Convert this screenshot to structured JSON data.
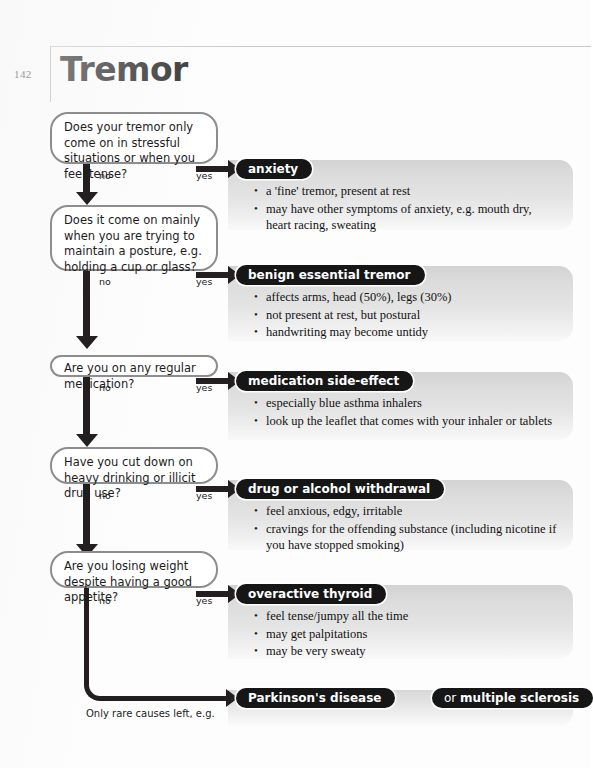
{
  "header": {
    "page_number": "142",
    "title": "Tremor"
  },
  "branch_labels": {
    "no": "no",
    "yes": "yes"
  },
  "footer_note": "Only rare causes left, e.g.",
  "questions": [
    {
      "text": "Does your tremor only come on in stressful situations or when you feel tense?"
    },
    {
      "text": "Does it come on mainly when you are trying to maintain a posture, e.g. holding a cup or glass?"
    },
    {
      "text": "Are you on any regular medication?"
    },
    {
      "text": "Have you cut down on heavy drinking or illicit drug use?"
    },
    {
      "text": "Are you losing weight despite having a good appetite?"
    }
  ],
  "outcomes": [
    {
      "tag": "anxiety",
      "bullets": [
        "a 'fine' tremor, present at rest",
        "may have other symptoms of anxiety, e.g. mouth dry, heart racing, sweating"
      ]
    },
    {
      "tag": "benign essential tremor",
      "bullets": [
        "affects arms, head (50%), legs (30%)",
        "not present at rest, but postural",
        "handwriting may become untidy"
      ]
    },
    {
      "tag": "medication side-effect",
      "bullets": [
        "especially blue asthma inhalers",
        "look up the leaflet that comes with your inhaler or tablets"
      ]
    },
    {
      "tag": "drug or alcohol withdrawal",
      "bullets": [
        "feel anxious, edgy, irritable",
        "cravings for the offending substance (including nicotine if you have stopped smoking)"
      ]
    },
    {
      "tag": "overactive thyroid",
      "bullets": [
        "feel tense/jumpy all the time",
        "may get palpitations",
        "may be very sweaty"
      ]
    }
  ],
  "final": {
    "primary_tag": "Parkinson's disease",
    "secondary_prefix": "or ",
    "secondary_tag": "multiple sclerosis"
  },
  "colors": {
    "tag_background": "#161616",
    "tag_text": "#ffffff",
    "connector": "#231f20",
    "question_border": "#8d8d8d",
    "panel_top": "#d3d3d3",
    "panel_bottom": "#f9f9f9",
    "page_background": "#ffffff"
  }
}
